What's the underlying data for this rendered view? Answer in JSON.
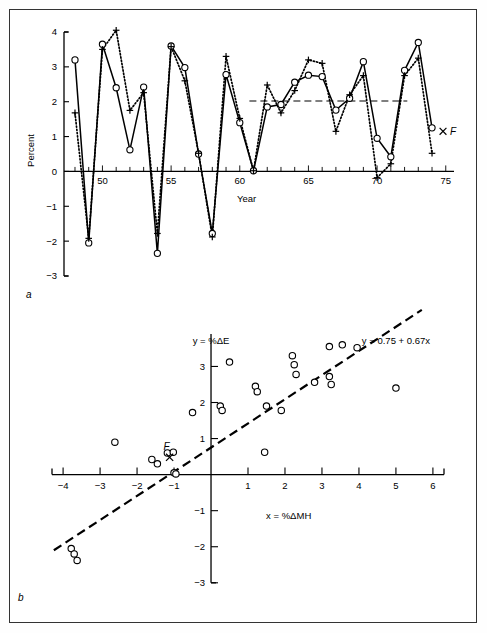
{
  "figure": {
    "panel_a_label": "a",
    "panel_b_label": "b"
  },
  "chart_data": [
    {
      "type": "line",
      "panel": "a",
      "title": "",
      "xlabel": "Year",
      "ylabel": "Percent",
      "xlim": [
        47.2,
        75.6
      ],
      "ylim": [
        -3,
        4
      ],
      "grid": false,
      "x_tick_labels": [
        "50",
        "55",
        "60",
        "65",
        "70",
        "75"
      ],
      "x_tick_values": [
        50,
        55,
        60,
        65,
        70,
        75
      ],
      "x_minor_step": 1,
      "y_tick_labels": [
        "-3",
        "-2",
        "-1",
        "0",
        "1",
        "2",
        "3",
        "4"
      ],
      "y_tick_values": [
        -3,
        -2,
        -1,
        0,
        1,
        2,
        3,
        4
      ],
      "x": [
        48,
        49,
        50,
        51,
        52,
        53,
        54,
        55,
        56,
        57,
        58,
        59,
        60,
        61,
        62,
        63,
        64,
        65,
        66,
        67,
        68,
        69,
        70,
        71,
        72,
        73,
        74
      ],
      "series": [
        {
          "name": "%ΔE",
          "marker": "circle",
          "line_style": "solid",
          "values": [
            3.2,
            -2.05,
            3.65,
            2.4,
            0.62,
            2.42,
            -2.35,
            3.6,
            2.98,
            0.5,
            -1.78,
            2.78,
            1.4,
            0.02,
            1.85,
            1.92,
            2.56,
            2.76,
            2.72,
            1.76,
            2.1,
            3.15,
            0.95,
            0.42,
            2.9,
            3.7,
            1.25
          ]
        },
        {
          "name": "%ΔMH",
          "marker": "plus",
          "line_style": "dotted",
          "values": [
            1.68,
            -1.92,
            3.5,
            4.05,
            1.75,
            2.26,
            -1.78,
            3.58,
            2.6,
            0.52,
            -1.88,
            3.3,
            1.52,
            0.02,
            2.48,
            1.68,
            2.32,
            3.2,
            3.1,
            1.15,
            2.2,
            2.75,
            -0.18,
            0.22,
            2.75,
            3.25,
            0.52
          ]
        }
      ],
      "reference_line": {
        "y": 2.02,
        "x_start": 60.7,
        "x_end": 72.2,
        "style": "dashed"
      },
      "annotations": [
        {
          "text": "F",
          "x": 74.8,
          "y": 1.15,
          "marker": "x"
        }
      ]
    },
    {
      "type": "scatter",
      "panel": "b",
      "title": "",
      "xlabel": "x = %ΔMH",
      "ylabel": "y = %ΔE",
      "xlim": [
        -4.3,
        6.3
      ],
      "ylim": [
        -3.2,
        3.9
      ],
      "grid": false,
      "x_tick_labels": [
        "-4",
        "-3",
        "-2",
        "-1",
        "1",
        "2",
        "3",
        "4",
        "5",
        "6"
      ],
      "x_tick_values": [
        -4,
        -3,
        -2,
        -1,
        1,
        2,
        3,
        4,
        5,
        6
      ],
      "y_tick_labels": [
        "-3",
        "-2",
        "-1",
        "1",
        "2",
        "3"
      ],
      "y_tick_values": [
        -3,
        -2,
        -1,
        1,
        2,
        3
      ],
      "points": [
        [
          -3.78,
          -2.05
        ],
        [
          -3.7,
          -2.2
        ],
        [
          -3.62,
          -2.38
        ],
        [
          -2.6,
          0.9
        ],
        [
          -1.6,
          0.42
        ],
        [
          -1.45,
          0.3
        ],
        [
          -1.18,
          0.6
        ],
        [
          -1.0,
          0.05
        ],
        [
          -0.95,
          0.02
        ],
        [
          -1.02,
          0.62
        ],
        [
          -0.5,
          1.72
        ],
        [
          0.25,
          1.9
        ],
        [
          0.3,
          1.78
        ],
        [
          0.5,
          3.12
        ],
        [
          1.2,
          2.45
        ],
        [
          1.25,
          2.3
        ],
        [
          1.45,
          0.62
        ],
        [
          1.5,
          1.9
        ],
        [
          1.9,
          1.78
        ],
        [
          2.2,
          3.3
        ],
        [
          2.25,
          3.05
        ],
        [
          2.3,
          2.78
        ],
        [
          2.8,
          2.56
        ],
        [
          3.2,
          2.72
        ],
        [
          3.25,
          2.5
        ],
        [
          3.2,
          3.55
        ],
        [
          3.55,
          3.6
        ],
        [
          3.95,
          3.52
        ],
        [
          5.0,
          2.4
        ]
      ],
      "special_point": {
        "label": "F",
        "x": -1.12,
        "y": 0.48,
        "marker": "x"
      },
      "regression": {
        "equation_label": "y = 0.75 + 0.67x",
        "intercept": 0.75,
        "slope": 0.67,
        "style": "dashed",
        "x_start": -4.25,
        "x_end": 5.7
      }
    }
  ]
}
